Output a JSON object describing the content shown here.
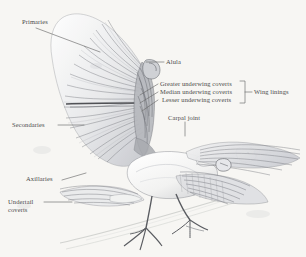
{
  "figure": {
    "type": "anatomical-illustration",
    "medium": "pencil-drawing",
    "background_color": "#f7f6f3",
    "label_color": "#4a4a4a",
    "leader_line_color": "#6b6b6b",
    "graphite_dark": "#4d4d52",
    "graphite_mid": "#8f9197",
    "graphite_light": "#c9cbd0",
    "plumage_white": "#fbfbfa"
  },
  "labels": {
    "primaries": "Primaries",
    "alula": "Alula",
    "greater_underwing_coverts": "Greater underwing coverts",
    "median_underwing_coverts": "Median underwing coverts",
    "lesser_underwing_coverts": "Lesser underwing coverts",
    "wing_linings": "Wing linings",
    "carpal_joint": "Carpal joint",
    "secondaries": "Secondaries",
    "axillaries": "Axillaries",
    "undertail_coverts_line1": "Undertail",
    "undertail_coverts_line2": "coverts"
  },
  "bracket": {
    "groups_labels": [
      "Greater underwing coverts",
      "Median underwing coverts",
      "Lesser underwing coverts"
    ],
    "group_name": "Wing linings"
  }
}
